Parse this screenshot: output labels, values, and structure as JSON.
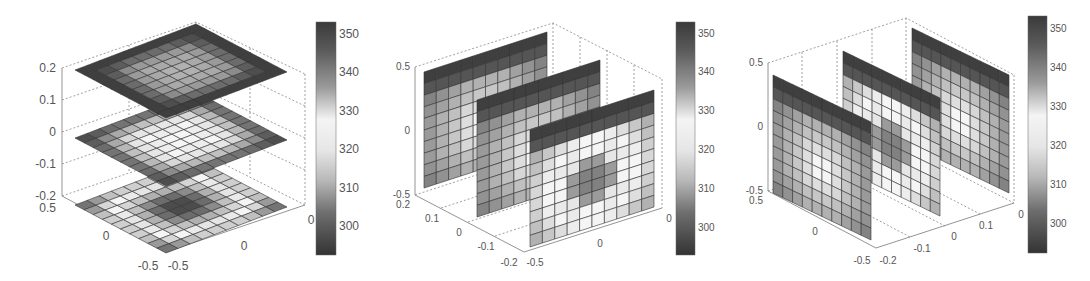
{
  "chart_data": [
    {
      "type": "heatmap",
      "title": "",
      "description": "3D slice plot: three horizontal z-slices of a scalar field on a 10x10 grid",
      "slice_orientation": "horizontal",
      "slice_positions": {
        "axis": "z",
        "values": [
          0.2,
          0,
          -0.2
        ]
      },
      "axes": {
        "z": {
          "ticks": [
            "0.2",
            "0.1",
            "0",
            "-0.1",
            "-0.2"
          ],
          "range": [
            -0.2,
            0.2
          ]
        },
        "x": {
          "ticks": [
            "0.5",
            "0",
            "-0.5"
          ],
          "range": [
            -0.5,
            0.5
          ]
        },
        "y": {
          "ticks": [
            "-0.5",
            "0"
          ],
          "range": [
            -0.5,
            0.5
          ]
        }
      },
      "colorbar": {
        "ticks": [
          "350",
          "340",
          "330",
          "320",
          "310",
          "300"
        ],
        "range": [
          292,
          353
        ],
        "colormap": "grayscale-diverging (dark-light-dark)"
      },
      "slices": [
        {
          "label": "z=0.2",
          "pattern": "dark border, medium-gray interior",
          "values": [
            [
              352,
              352,
              352,
              352,
              352,
              352,
              352,
              352,
              352,
              352
            ],
            [
              352,
              350,
              348,
              346,
              346,
              346,
              346,
              348,
              350,
              352
            ],
            [
              352,
              348,
              342,
              340,
              340,
              340,
              340,
              342,
              348,
              352
            ],
            [
              352,
              346,
              340,
              338,
              338,
              338,
              338,
              340,
              346,
              352
            ],
            [
              352,
              346,
              340,
              338,
              337,
              337,
              338,
              340,
              346,
              352
            ],
            [
              352,
              346,
              340,
              338,
              337,
              337,
              338,
              340,
              346,
              352
            ],
            [
              352,
              346,
              340,
              338,
              338,
              338,
              338,
              340,
              346,
              352
            ],
            [
              352,
              348,
              342,
              340,
              340,
              340,
              340,
              342,
              348,
              352
            ],
            [
              352,
              350,
              348,
              346,
              346,
              346,
              346,
              348,
              350,
              352
            ],
            [
              352,
              352,
              352,
              352,
              352,
              352,
              352,
              352,
              352,
              352
            ]
          ]
        },
        {
          "label": "z=0",
          "pattern": "dark border, light interior",
          "values": [
            [
              350,
              348,
              346,
              345,
              345,
              345,
              345,
              346,
              348,
              350
            ],
            [
              348,
              342,
              338,
              336,
              335,
              335,
              336,
              338,
              342,
              348
            ],
            [
              346,
              338,
              332,
              330,
              330,
              330,
              330,
              332,
              338,
              346
            ],
            [
              345,
              336,
              330,
              328,
              329,
              329,
              328,
              330,
              336,
              345
            ],
            [
              345,
              335,
              330,
              329,
              328,
              328,
              329,
              330,
              335,
              345
            ],
            [
              345,
              335,
              330,
              329,
              328,
              328,
              329,
              330,
              335,
              345
            ],
            [
              345,
              336,
              330,
              328,
              329,
              329,
              328,
              330,
              336,
              345
            ],
            [
              346,
              338,
              332,
              330,
              330,
              330,
              330,
              332,
              338,
              346
            ],
            [
              348,
              342,
              338,
              336,
              335,
              335,
              336,
              338,
              342,
              348
            ],
            [
              350,
              348,
              346,
              345,
              345,
              345,
              345,
              346,
              348,
              350
            ]
          ]
        },
        {
          "label": "z=-0.2",
          "pattern": "dark border, light ring, dark center",
          "values": [
            [
              345,
              340,
              335,
              333,
              333,
              333,
              333,
              335,
              340,
              345
            ],
            [
              340,
              332,
              328,
              326,
              325,
              325,
              326,
              328,
              332,
              340
            ],
            [
              335,
              328,
              322,
              318,
              315,
              315,
              318,
              322,
              328,
              335
            ],
            [
              333,
              326,
              318,
              308,
              302,
              302,
              308,
              318,
              326,
              333
            ],
            [
              333,
              325,
              315,
              302,
              296,
              296,
              302,
              315,
              325,
              333
            ],
            [
              333,
              325,
              315,
              302,
              296,
              296,
              302,
              315,
              325,
              333
            ],
            [
              333,
              326,
              318,
              308,
              302,
              302,
              308,
              318,
              326,
              333
            ],
            [
              335,
              328,
              322,
              318,
              315,
              315,
              318,
              322,
              328,
              335
            ],
            [
              340,
              332,
              328,
              326,
              325,
              325,
              326,
              328,
              332,
              340
            ],
            [
              345,
              340,
              335,
              333,
              333,
              333,
              333,
              335,
              340,
              345
            ]
          ]
        }
      ]
    },
    {
      "type": "heatmap",
      "title": "",
      "description": "3D slice plot: three vertical slices perpendicular to x-axis",
      "slice_orientation": "vertical-yz",
      "slice_positions": {
        "axis": "x",
        "values": [
          0.2,
          0,
          -0.2
        ]
      },
      "axes": {
        "z": {
          "ticks": [
            "0.5",
            "0",
            "-0.5"
          ],
          "range": [
            -0.5,
            0.5
          ]
        },
        "x": {
          "ticks": [
            "0.2",
            "0.1",
            "0",
            "-0.1",
            "-0.2"
          ],
          "range": [
            -0.2,
            0.2
          ]
        },
        "y": {
          "ticks": [
            "-0.5",
            "0"
          ],
          "range": [
            -0.5,
            0.5
          ]
        }
      },
      "colorbar": {
        "ticks": [
          "350",
          "340",
          "330",
          "320",
          "310",
          "300"
        ],
        "range": [
          292,
          353
        ]
      },
      "slices": [
        {
          "label": "x=0.2",
          "pattern": "dark top/left, light interior"
        },
        {
          "label": "x=0",
          "pattern": "dark top/left, lighter interior"
        },
        {
          "label": "x=-0.2",
          "pattern": "dark top/left, light ring, dark center-lower"
        }
      ]
    },
    {
      "type": "heatmap",
      "title": "",
      "description": "3D slice plot: three vertical slices perpendicular to y-axis",
      "slice_orientation": "vertical-xz",
      "slice_positions": {
        "axis": "y",
        "values": [
          -0.2,
          0,
          0.2
        ]
      },
      "axes": {
        "z": {
          "ticks": [
            "0.5",
            "0",
            "-0.5"
          ],
          "range": [
            -0.5,
            0.5
          ]
        },
        "x": {
          "ticks": [
            "0.5",
            "0",
            "-0.5"
          ],
          "range": [
            -0.5,
            0.5
          ]
        },
        "y": {
          "ticks": [
            "-0.2",
            "-0.1",
            "0",
            "0.1"
          ],
          "range": [
            -0.2,
            0.2
          ]
        }
      },
      "colorbar": {
        "ticks": [
          "350",
          "340",
          "330",
          "320",
          "310",
          "300"
        ],
        "range": [
          292,
          353
        ]
      },
      "slices": [
        {
          "label": "y=-0.2",
          "pattern": "dark top, light interior"
        },
        {
          "label": "y=0",
          "pattern": "dark top, light ring, dark lower-center"
        },
        {
          "label": "y=0.2",
          "pattern": "dark top/right, light interior with darker spots"
        }
      ]
    }
  ],
  "panels": [
    {
      "colorbar_labels": [
        "350",
        "340",
        "330",
        "320",
        "310",
        "300"
      ],
      "z_labels": [
        "0.2",
        "0.1",
        "0",
        "-0.1",
        "-0.2"
      ],
      "x_labels": [
        "0.5",
        "0",
        "-0.5"
      ],
      "y_labels": [
        "-0.5",
        "0"
      ],
      "right_label": "0"
    },
    {
      "colorbar_labels": [
        "350",
        "340",
        "330",
        "320",
        "310",
        "300"
      ],
      "z_labels": [
        "0.5",
        "0",
        "-0.5"
      ],
      "x_labels": [
        "0.2",
        "0.1",
        "0",
        "-0.1",
        "-0.2"
      ],
      "y_labels": [
        "-0.5",
        "0"
      ],
      "right_label": "0"
    },
    {
      "colorbar_labels": [
        "350",
        "340",
        "330",
        "320",
        "310",
        "300"
      ],
      "z_labels": [
        "0.5",
        "0",
        "-0.5"
      ],
      "x_labels": [
        "0.5",
        "0",
        "-0.5"
      ],
      "y_labels": [
        "-0.2",
        "-0.1",
        "0",
        "0.1"
      ],
      "right_label": "0"
    }
  ]
}
